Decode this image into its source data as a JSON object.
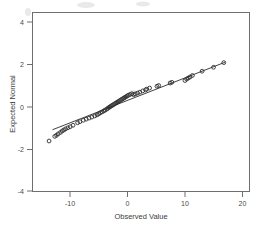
{
  "chart_data": {
    "type": "scatter",
    "title": "",
    "subtitle": "",
    "xlabel": "Observed Value",
    "ylabel": "Expected Normal",
    "xlim": [
      -15.5,
      22.5
    ],
    "ylim": [
      -5.0,
      5.0
    ],
    "xticks": [
      -10,
      0,
      10,
      20
    ],
    "xticklabels": [
      "-10",
      "0",
      "10",
      "20"
    ],
    "yticks": [
      4,
      2,
      0,
      -2,
      -4
    ],
    "yticklabels": [
      "4",
      "2",
      "0",
      "-2",
      "-4"
    ],
    "grid": false,
    "legend": null,
    "marker": "open-circle",
    "series": [
      {
        "name": "Q-Q points",
        "x": [
          -12.6,
          -11.6,
          -11.3,
          -11.0,
          -10.6,
          -10.3,
          -10.0,
          -9.7,
          -9.3,
          -8.9,
          -8.4,
          -7.6,
          -7.2,
          -6.6,
          -6.1,
          -5.6,
          -5.1,
          -4.6,
          -4.2,
          -3.9,
          -3.6,
          -3.3,
          -3.0,
          -2.8,
          -2.5,
          -2.3,
          -2.1,
          -1.9,
          -1.7,
          -1.5,
          -1.3,
          -1.1,
          -0.9,
          -0.7,
          -0.5,
          -0.3,
          -0.1,
          0.1,
          0.3,
          0.5,
          0.7,
          0.9,
          1.1,
          1.3,
          1.6,
          1.9,
          2.2,
          2.5,
          2.9,
          3.3,
          3.8,
          4.3,
          4.5,
          5.0,
          6.3,
          6.6,
          8.6,
          8.9,
          11.2,
          11.5,
          11.8,
          12.1,
          12.5,
          14.2,
          16.2,
          18.0
        ],
        "y": [
          -2.18,
          -1.92,
          -1.86,
          -1.78,
          -1.7,
          -1.62,
          -1.56,
          -1.5,
          -1.44,
          -1.38,
          -1.3,
          -1.16,
          -1.1,
          -1.02,
          -0.96,
          -0.9,
          -0.84,
          -0.78,
          -0.72,
          -0.66,
          -0.6,
          -0.55,
          -0.5,
          -0.45,
          -0.4,
          -0.35,
          -0.3,
          -0.26,
          -0.22,
          -0.18,
          -0.14,
          -0.1,
          -0.06,
          -0.02,
          0.02,
          0.06,
          0.1,
          0.14,
          0.18,
          0.22,
          0.26,
          0.3,
          0.34,
          0.38,
          0.42,
          0.46,
          0.41,
          0.45,
          0.5,
          0.55,
          0.62,
          0.68,
          0.72,
          0.78,
          0.88,
          0.92,
          1.06,
          1.1,
          1.2,
          1.28,
          1.34,
          1.4,
          1.48,
          1.72,
          1.94,
          2.2
        ]
      }
    ],
    "reference_line": {
      "name": "normal reference line",
      "x_start": -12.0,
      "y_start": -1.55,
      "x_end": 18.2,
      "y_end": 2.22
    }
  },
  "axes": {
    "x_title": "Observed Value",
    "y_title": "Expected Normal"
  }
}
